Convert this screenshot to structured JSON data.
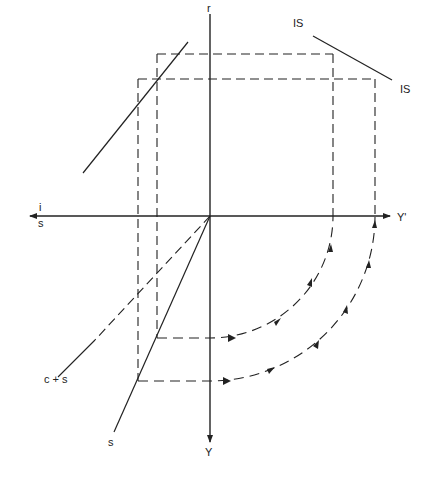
{
  "diagram": {
    "type": "four-quadrant macroeconomic diagram",
    "labels": {
      "vertical_axis_top": "r",
      "vertical_axis_bottom": "Y",
      "horizontal_axis_left_top": "i",
      "horizontal_axis_left_bottom": "s",
      "horizontal_axis_right": "Y'",
      "is_curve_top": "IS",
      "is_curve_bottom": "IS",
      "consumption_saving_line": "c + s",
      "saving_line": "s"
    },
    "colors": {
      "line": "#222222",
      "background": "#ffffff"
    }
  }
}
